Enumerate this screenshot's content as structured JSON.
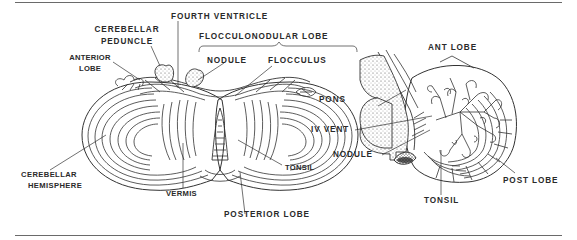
{
  "figure": {
    "type": "anatomical-illustration",
    "left_view": {
      "labels": {
        "fourth_ventricle": "FOURTH VENTRICLE",
        "cerebellar_peduncle_1": "CEREBELLAR",
        "cerebellar_peduncle_2": "PEDUNCLE",
        "flocculonodular_lobe": "FLOCCULONODULAR  LOBE",
        "anterior_lobe_1": "ANTERIOR",
        "anterior_lobe_2": "LOBE",
        "nodule": "NODULE",
        "flocculus": "FLOCCULUS",
        "cerebellar_hemisphere_1": "CEREBELLAR",
        "cerebellar_hemisphere_2": "HEMISPHERE",
        "vermis": "VERMIS",
        "tonsil": "TONSIL",
        "posterior_lobe": "POSTERIOR LOBE"
      }
    },
    "right_view": {
      "labels": {
        "ant_lobe": "ANT LOBE",
        "pons": "PONS",
        "iv_vent": "IV VENT",
        "nodule": "NODULE",
        "post_lobe": "POST LOBE",
        "tonsil": "TONSIL"
      }
    },
    "colors": {
      "ink": "#2a2a2a",
      "rule": "#6a6a6a",
      "background": "#ffffff"
    }
  }
}
